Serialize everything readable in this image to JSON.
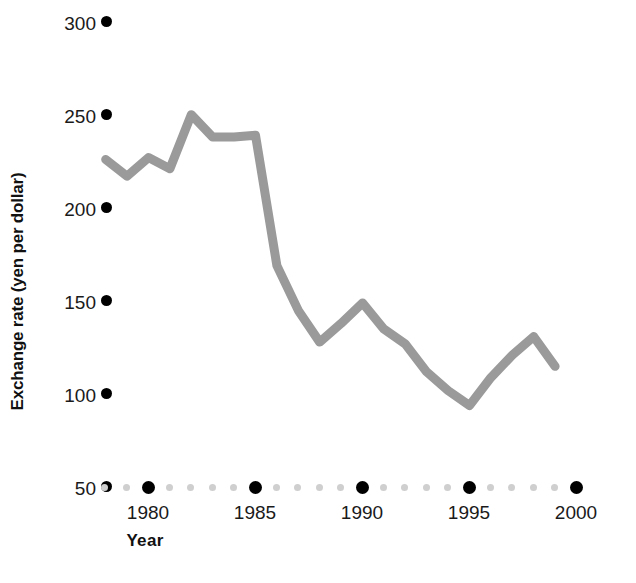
{
  "chart_data": {
    "type": "line",
    "title": "",
    "xlabel": "Year",
    "ylabel": "Exchange rate (yen per dollar)",
    "xlim": [
      1978,
      2000
    ],
    "ylim": [
      50,
      300
    ],
    "grid": false,
    "legend": "none",
    "line_color": "#9a9a9a",
    "line_width_px": 9,
    "x_tick_labels": [
      "1980",
      "1985",
      "1990",
      "1995",
      "2000"
    ],
    "x_major_ticks": [
      1980,
      1985,
      1990,
      1995,
      2000
    ],
    "x_minor_ticks": [
      1978,
      1979,
      1981,
      1982,
      1983,
      1984,
      1986,
      1987,
      1988,
      1989,
      1991,
      1992,
      1993,
      1994,
      1996,
      1997,
      1998,
      1999
    ],
    "y_tick_labels": [
      "300",
      "250",
      "200",
      "150",
      "100",
      "50"
    ],
    "y_ticks": [
      300,
      250,
      200,
      150,
      100,
      50
    ],
    "x": [
      1978,
      1979,
      1980,
      1981,
      1982,
      1983,
      1984,
      1985,
      1986,
      1987,
      1988,
      1989,
      1990,
      1991,
      1992,
      1993,
      1994,
      1995,
      1996,
      1997,
      1998,
      1999
    ],
    "values": [
      226,
      217,
      227,
      221,
      250,
      238,
      238,
      239,
      169,
      145,
      128,
      138,
      149,
      135,
      127,
      112,
      102,
      94,
      109,
      121,
      131,
      115
    ],
    "series": [
      {
        "name": "Exchange rate (yen per dollar)",
        "values": [
          226,
          217,
          227,
          221,
          250,
          238,
          238,
          239,
          169,
          145,
          128,
          138,
          149,
          135,
          127,
          112,
          102,
          94,
          109,
          121,
          131,
          115
        ]
      }
    ]
  },
  "axes": {
    "y_title": "Exchange rate (yen per dollar)",
    "x_title": "Year",
    "y_labels": [
      {
        "text": "300"
      },
      {
        "text": "250"
      },
      {
        "text": "200"
      },
      {
        "text": "150"
      },
      {
        "text": "100"
      },
      {
        "text": "50"
      }
    ],
    "x_labels": [
      {
        "text": "1980"
      },
      {
        "text": "1985"
      },
      {
        "text": "1990"
      },
      {
        "text": "1995"
      },
      {
        "text": "2000"
      }
    ]
  },
  "colors": {
    "line": "#9a9a9a",
    "tick_dot_major": "#000000",
    "tick_dot_minor": "#cfcfcf",
    "text": "#1a1a1a",
    "background": "#ffffff"
  }
}
